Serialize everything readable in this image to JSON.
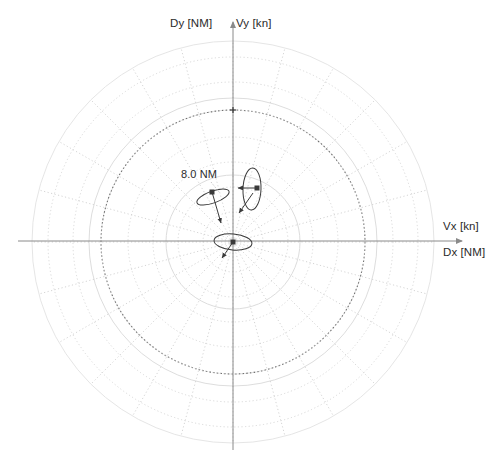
{
  "figure": {
    "kind": "polar-radar-plot",
    "background_color": "#ffffff"
  },
  "axes": {
    "vertical_top_left_label": "Dy [NM]",
    "vertical_top_right_label": "Vy [kn]",
    "horizontal_right_top_label": "Vx [kn]",
    "horizontal_right_bottom_label": "Dx [NM]",
    "axis_color": "#8a8a8a"
  },
  "annotations": {
    "range_ring_label": "8.0 NM"
  },
  "chart_data": {
    "type": "scatter",
    "title": "",
    "subtitle": "",
    "xlabel": "Dx [NM] / Vx [kn]",
    "ylabel": "Dy [NM] / Vy [kn]",
    "projection": "polar",
    "grid": true,
    "legend": false,
    "center_px": [
      233,
      242
    ],
    "range_rings": [
      {
        "label": "",
        "radius_px": 67,
        "style": "solid",
        "color": "#d8d8d8"
      },
      {
        "label": "8.0 NM",
        "radius_px": 132,
        "style": "dotted",
        "color": "#707070"
      },
      {
        "label": "",
        "radius_px": 144,
        "style": "solid",
        "color": "#d9d9d9"
      },
      {
        "label": "",
        "radius_px": 201,
        "style": "solid",
        "color": "#e2e2e2"
      }
    ],
    "radial_spokes": {
      "count": 24,
      "spacing_deg": 15,
      "style": "dotted",
      "color": "#c9c9c9",
      "inner_radius_px": 0,
      "outer_radius_px": 201
    },
    "dotted_arcs": {
      "radii_px": [
        30,
        55,
        80,
        105,
        132,
        160,
        185
      ],
      "style": "dotted",
      "color": "#cfcfcf"
    },
    "ellipses": [
      {
        "name": "uncertainty-ellipse-center",
        "center_px": [
          233,
          242
        ],
        "semi_major_px": 19,
        "semi_minor_px": 8,
        "rotation_deg": 95,
        "marker": {
          "type": "filled-square",
          "px": [
            233,
            242
          ],
          "size_px": 5
        },
        "velocity_vector_px": [
          [
            233,
            242
          ],
          [
            222,
            258
          ]
        ]
      },
      {
        "name": "uncertainty-ellipse-left",
        "center_px": [
          213,
          197
        ],
        "semi_major_px": 17,
        "semi_minor_px": 6,
        "rotation_deg": 70,
        "marker": {
          "type": "filled-square",
          "px": [
            212,
            192
          ],
          "size_px": 5
        },
        "velocity_vector_px": [
          [
            212,
            192
          ],
          [
            221,
            223
          ]
        ]
      },
      {
        "name": "uncertainty-ellipse-upper-right",
        "center_px": [
          252,
          189
        ],
        "semi_major_px": 21,
        "semi_minor_px": 9,
        "rotation_deg": 2,
        "marker": {
          "type": "filled-square",
          "px": [
            257,
            188
          ],
          "size_px": 5
        },
        "velocity_vector_px": [
          [
            257,
            188
          ],
          [
            238,
            188
          ]
        ],
        "leader_vector_px": [
          [
            253,
            193
          ],
          [
            239,
            213
          ]
        ]
      }
    ],
    "tick_markers": [
      {
        "name": "top-range-tick",
        "px": [
          233,
          110
        ],
        "type": "cross"
      }
    ],
    "trace_color": "#3a3a3a",
    "xlim": [
      -201,
      201
    ],
    "ylim": [
      -201,
      201
    ]
  }
}
